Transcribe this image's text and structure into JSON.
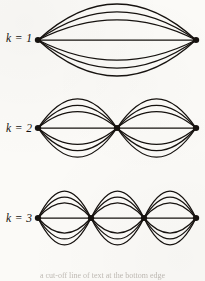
{
  "figure": {
    "type": "diagram",
    "background_color": "#fbfaf7",
    "ink_color": "#16120f",
    "canvas": {
      "width": 205,
      "height": 281
    },
    "rows": [
      {
        "label": "k = 1",
        "label_x": 6,
        "label_y": 33,
        "k": 1,
        "lobes": 1,
        "vertices_x": [
          38,
          196
        ],
        "baseline_y": 40,
        "max_arc_height": 36,
        "arcs_per_lobe": 7,
        "vertex_count": 2,
        "svg": {
          "x": 28,
          "y": 0,
          "width": 177,
          "height": 82
        }
      },
      {
        "label": "k = 2",
        "label_x": 6,
        "label_y": 123,
        "k": 2,
        "lobes": 2,
        "vertices_x": [
          38,
          117,
          196
        ],
        "baseline_y": 40,
        "max_arc_height": 36,
        "arcs_per_lobe": 7,
        "vertex_count": 3,
        "svg": {
          "x": 28,
          "y": 88,
          "width": 177,
          "height": 82
        }
      },
      {
        "label": "k = 3",
        "label_x": 6,
        "label_y": 213,
        "k": 3,
        "lobes": 3,
        "vertices_x": [
          38,
          91,
          144,
          196
        ],
        "baseline_y": 40,
        "max_arc_height": 36,
        "arcs_per_lobe": 7,
        "vertex_count": 4,
        "svg": {
          "x": 28,
          "y": 178,
          "width": 177,
          "height": 82
        }
      }
    ],
    "caption_partial": "a cut-off line of text at the bottom edge"
  }
}
